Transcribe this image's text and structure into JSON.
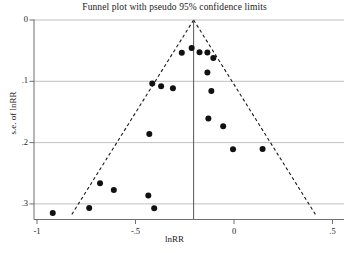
{
  "chart_data": {
    "type": "scatter",
    "title": "Funnel plot with pseudo 95% confidence limits",
    "xlabel": "lnRR",
    "ylabel": "s.e. of lnRR",
    "xlim": [
      -1.05,
      0.52
    ],
    "ylim": [
      0.33,
      0.0
    ],
    "y_inverted": true,
    "grid": "horizontal",
    "legend": "none",
    "xticks": [
      -1,
      -0.5,
      0,
      0.5
    ],
    "xtick_labels": [
      "-1",
      "-.5",
      "0",
      ".5"
    ],
    "yticks": [
      0,
      0.1,
      0.2,
      0.3
    ],
    "ytick_labels": [
      "0",
      ".1",
      ".2",
      ".3"
    ],
    "x": [
      -0.265,
      -0.215,
      -0.175,
      -0.135,
      -0.105,
      -0.135,
      -0.415,
      -0.37,
      -0.31,
      -0.115,
      -0.13,
      -0.055,
      -0.005,
      0.145,
      -0.43,
      -0.68,
      -0.61,
      -0.435,
      -0.735,
      -0.405,
      -0.92
    ],
    "y": [
      0.0535,
      0.0455,
      0.0525,
      0.053,
      0.062,
      0.0855,
      0.1035,
      0.108,
      0.1115,
      0.116,
      0.1605,
      0.1735,
      0.211,
      0.2105,
      0.186,
      0.2665,
      0.2775,
      0.2865,
      0.3065,
      0.307,
      0.315
    ],
    "series_name": "studies",
    "point_color": "#111111",
    "point_size_px": 4.2,
    "funnel": {
      "apex_x": -0.205,
      "apex_y": 0.0,
      "slope_z": 1.96,
      "style": "dashed",
      "color": "#1a1a1a",
      "left_end_x": -0.825,
      "right_end_x": 0.415,
      "end_y": 0.318
    },
    "center_line": {
      "x": -0.205,
      "style": "solid",
      "color": "#555555"
    }
  },
  "axes": {
    "title": "Funnel plot with pseudo 95% confidence limits",
    "ylabel": "s.e. of lnRR",
    "xlabel": "lnRR",
    "xtick_labels": [
      "-1",
      "-.5",
      "0",
      ".5"
    ],
    "ytick_labels": [
      "0",
      ".1",
      ".2",
      ".3"
    ]
  }
}
